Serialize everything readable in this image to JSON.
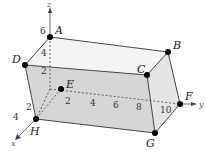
{
  "diagram": {
    "type": "3d-rectangular-box",
    "axes": {
      "x": {
        "label": "x",
        "ticks": [
          "2",
          "4"
        ]
      },
      "y": {
        "label": "y",
        "ticks": [
          "2",
          "4",
          "6",
          "8",
          "10"
        ]
      },
      "z": {
        "label": "z",
        "ticks": [
          "2",
          "4",
          "6"
        ]
      }
    },
    "vertices": [
      {
        "label": "A",
        "x": 50,
        "y": 37
      },
      {
        "label": "B",
        "x": 168,
        "y": 52
      },
      {
        "label": "C",
        "x": 147,
        "y": 75
      },
      {
        "label": "D",
        "x": 25,
        "y": 65
      },
      {
        "label": "E",
        "x": 61,
        "y": 89
      },
      {
        "label": "F",
        "x": 180,
        "y": 104
      },
      {
        "label": "G",
        "x": 155,
        "y": 133
      },
      {
        "label": "H",
        "x": 36,
        "y": 119
      }
    ],
    "colors": {
      "top_face": "#f4f4f4",
      "front_face": "#d6d6d6",
      "side_face": "#e4e4e4",
      "edge": "#333333",
      "vertex": "#000000"
    }
  }
}
